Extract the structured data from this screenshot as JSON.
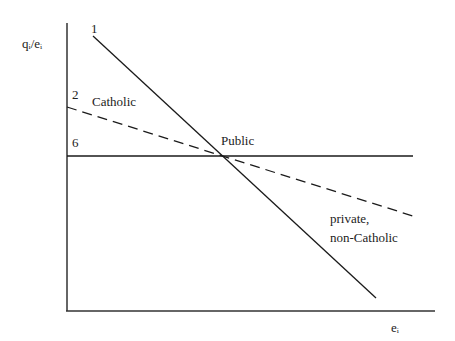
{
  "diagram": {
    "y_axis_label": "qᵢ/eᵢ",
    "x_axis_label": "eᵢ",
    "line_labels": {
      "solid_steep": "1",
      "dashed": "2",
      "horizontal": "6"
    },
    "region_labels": {
      "catholic": "Catholic",
      "public": "Public",
      "private_line1": "private,",
      "private_line2": "non-Catholic"
    },
    "colors": {
      "line": "#1a1a1a",
      "axis": "#333333",
      "background": "#ffffff"
    }
  }
}
